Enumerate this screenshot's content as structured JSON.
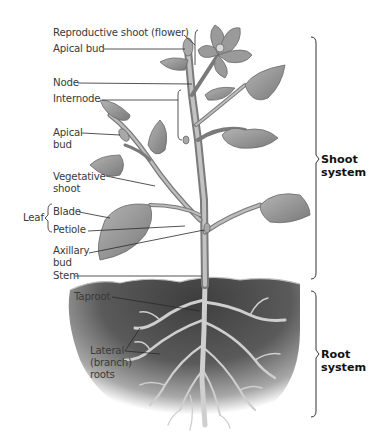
{
  "diagram": {
    "labels": {
      "reproductive_shoot": "Reproductive shoot (flower)",
      "apical_bud_top": "Apical bud",
      "node": "Node",
      "internode": "Internode",
      "apical_bud_side": "Apical\nbud",
      "vegetative_shoot": "Vegetative\nshoot",
      "leaf": "Leaf",
      "blade": "Blade",
      "petiole": "Petiole",
      "axillary_bud": "Axillary\nbud",
      "stem": "Stem",
      "taproot": "Taproot",
      "lateral_roots": "Lateral\n(branch)\nroots"
    },
    "systems": {
      "shoot": "Shoot\nsystem",
      "root": "Root\nsystem"
    },
    "colors": {
      "label_text": "#3a3a3a",
      "leader_line": "#2a2a2a",
      "plant_fill": "#9a9a9a",
      "plant_dark": "#6e6e6e",
      "soil_dark": "#4a4a4a",
      "root_fill": "#c8c8c8"
    }
  }
}
